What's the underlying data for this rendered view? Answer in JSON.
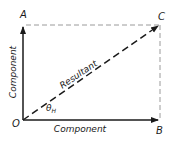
{
  "diagram": {
    "type": "vector-resolution",
    "points": {
      "O": {
        "label": "O",
        "x": 23,
        "y": 120
      },
      "A": {
        "label": "A",
        "x": 23,
        "y": 25
      },
      "B": {
        "label": "B",
        "x": 160,
        "y": 120
      },
      "C": {
        "label": "C",
        "x": 160,
        "y": 25
      }
    },
    "labels": {
      "vertical_component": "Component",
      "horizontal_component": "Component",
      "resultant": "Resultant",
      "angle": "θ",
      "angle_subscript": "H"
    },
    "colors": {
      "solid_line": "#1a1a1a",
      "dashed_guide": "#9a9a9a",
      "resultant": "#1a1a1a"
    }
  }
}
